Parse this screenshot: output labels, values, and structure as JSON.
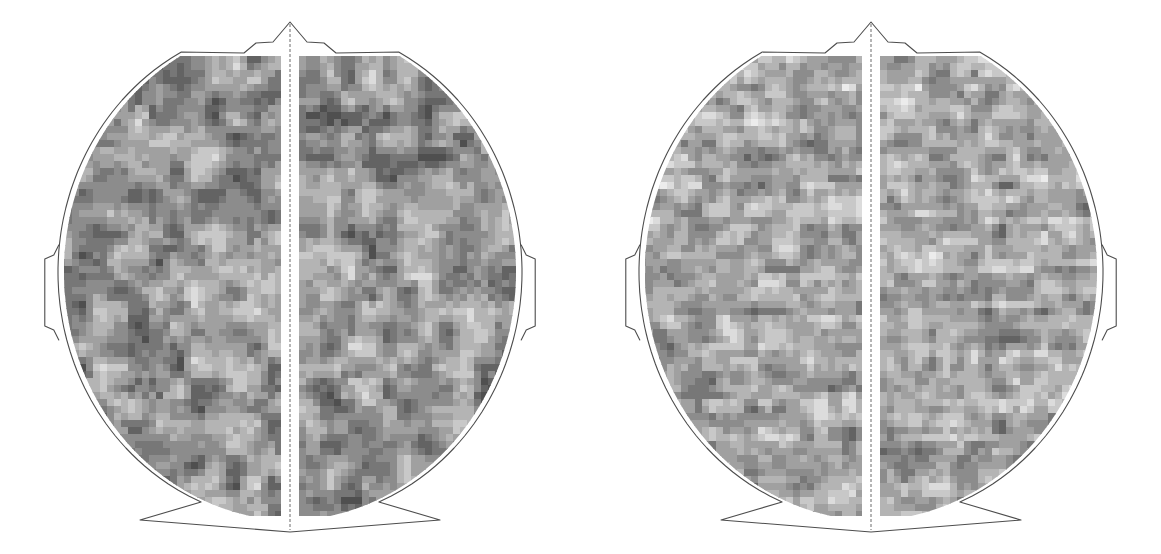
{
  "figure": {
    "title": "",
    "background_color": "#ffffff",
    "width": 1161,
    "height": 554,
    "panel_count": 2,
    "view": "top-down scalp view, nose at top"
  },
  "chart_data": {
    "type": "heatmap",
    "title": "",
    "subtitle": "",
    "xlabel": "",
    "ylabel": "",
    "grid": false,
    "legend": "none",
    "colormap": "grayscale",
    "colormap_levels": [
      "#4f4f4f",
      "#636363",
      "#777777",
      "#8c8c8c",
      "#a0a0a0",
      "#b4b4b4",
      "#c8c8c8",
      "#dcdcdc",
      "#ececec"
    ],
    "value_range": [
      0,
      8
    ],
    "cell_size_px": 7,
    "annotations": [],
    "panels": [
      {
        "name": "panel-left",
        "label": "",
        "seed": 10711,
        "texture": "blobby",
        "blob_scale": 0.052,
        "streak_scale": 0.0,
        "level_bias": -0.42,
        "level_gain": 1.18
      },
      {
        "name": "panel-right",
        "label": "",
        "seed": 55219,
        "texture": "streaked",
        "blob_scale": 0.072,
        "streak_scale": 0.3,
        "level_bias": 0.3,
        "level_gain": 1.3
      }
    ]
  },
  "head_outline": {
    "nose_label": "nose",
    "left_ear_label": "left-ear",
    "right_ear_label": "right-ear",
    "midline_label": "midline",
    "stroke_color": "#4d4d4d"
  }
}
